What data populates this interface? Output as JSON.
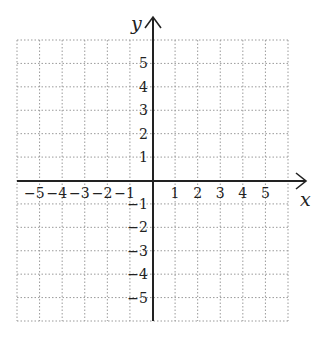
{
  "chart_data": {
    "type": "coordinate-grid",
    "title": "",
    "xlabel": "x",
    "ylabel": "y",
    "xlim": [
      -6,
      6
    ],
    "ylim": [
      -6,
      6
    ],
    "grid": true,
    "grid_style": "dotted",
    "x_tick_labels": [
      "-5",
      "-4",
      "-3",
      "-2",
      "-1",
      "1",
      "2",
      "3",
      "4",
      "5"
    ],
    "y_tick_labels": [
      "5",
      "4",
      "3",
      "2",
      "1",
      "-1",
      "-2",
      "-3",
      "-4",
      "-5"
    ],
    "x_ticks": [
      -5,
      -4,
      -3,
      -2,
      -1,
      1,
      2,
      3,
      4,
      5
    ],
    "y_ticks": [
      5,
      4,
      3,
      2,
      1,
      -1,
      -2,
      -3,
      -4,
      -5
    ],
    "series": []
  },
  "axes": {
    "x_label": "x",
    "y_label": "y",
    "colors": {
      "axis": "#222222",
      "grid": "#9a9a9a",
      "text": "#222222",
      "background": "#ffffff"
    }
  }
}
